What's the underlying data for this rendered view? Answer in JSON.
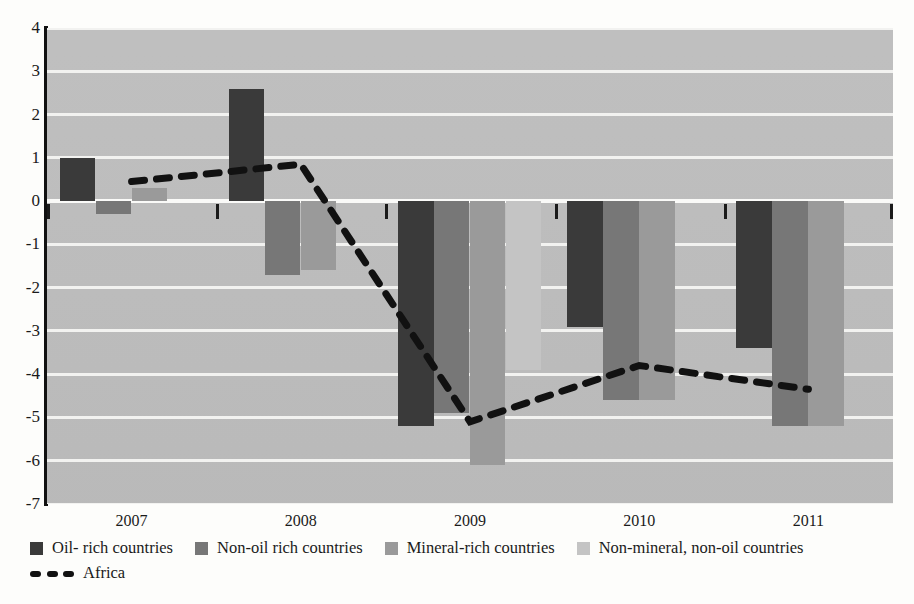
{
  "chart_data": {
    "type": "bar",
    "title": "",
    "subtitle": "",
    "xlabel": "",
    "ylabel": "",
    "categories": [
      "2007",
      "2008",
      "2009",
      "2010",
      "2011"
    ],
    "ylim": [
      -7,
      4
    ],
    "yticks": [
      4,
      3,
      2,
      1,
      0,
      -1,
      -2,
      -3,
      -4,
      -5,
      -6,
      -7
    ],
    "ytick_labels": [
      "4",
      "3",
      "2",
      "1",
      "0",
      "-1",
      "-2",
      "-3",
      "-4",
      "-5",
      "-6",
      "-7"
    ],
    "grid": true,
    "legend_position": "bottom-left",
    "series": [
      {
        "name": "Oil- rich countries",
        "type": "bar",
        "color": "#3a3a3a",
        "values": [
          1.0,
          2.6,
          -5.2,
          -2.9,
          -3.4
        ]
      },
      {
        "name": "Non-oil rich countries",
        "type": "bar",
        "color": "#777777",
        "values": [
          -0.3,
          -1.7,
          -4.9,
          -4.6,
          -5.2
        ]
      },
      {
        "name": "Mineral-rich countries",
        "type": "bar",
        "color": "#9a9a9a",
        "values": [
          0.3,
          -1.6,
          -6.1,
          -4.6,
          -5.2
        ]
      },
      {
        "name": "Non-mineral, non-oil countries",
        "type": "bar",
        "color": "#c4c4c4",
        "values": [
          0.0,
          0.0,
          -3.9,
          0.0,
          0.0
        ]
      },
      {
        "name": "Africa",
        "type": "line",
        "color": "#111111",
        "style": "dashed",
        "values": [
          0.45,
          0.85,
          -5.1,
          -3.8,
          -4.35
        ]
      }
    ]
  },
  "legend": {
    "row1": [
      {
        "label": "Oil- rich countries",
        "color": "#3a3a3a"
      },
      {
        "label": "Non-oil rich countries",
        "color": "#777777"
      },
      {
        "label": "Mineral-rich countries",
        "color": "#9a9a9a"
      },
      {
        "label": "Non-mineral, non-oil countries",
        "color": "#c4c4c4"
      }
    ],
    "row2": [
      {
        "label": "Africa",
        "color": "#111111"
      }
    ]
  },
  "axis": {
    "plot_bg": "#bdbdbd",
    "grid_color": "#f2f2f0",
    "axis_color": "#111111"
  }
}
